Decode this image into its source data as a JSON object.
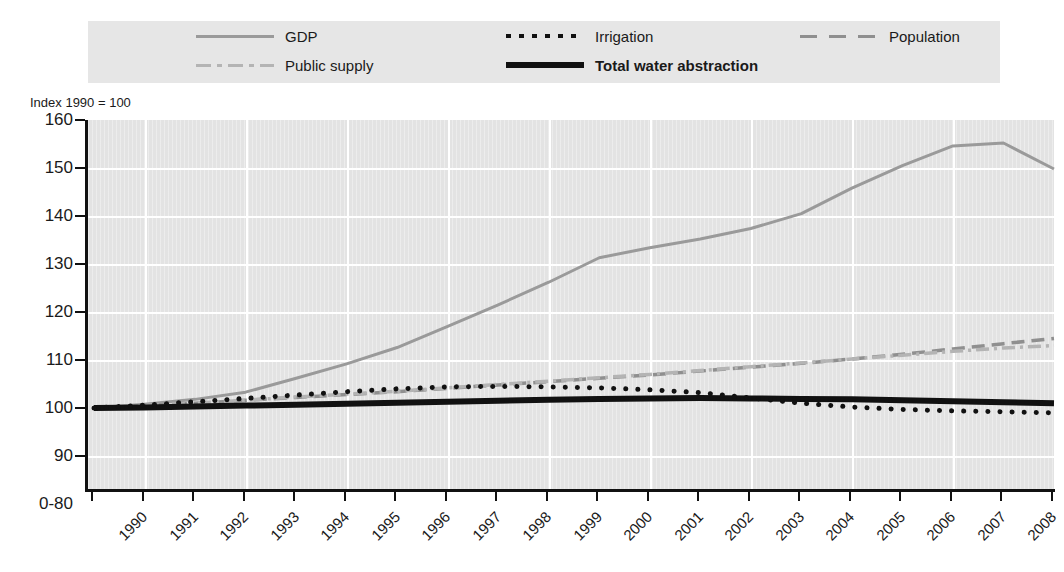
{
  "title": "",
  "axis_note": "Index 1990 = 100",
  "legend": {
    "items": [
      {
        "label": "GDP",
        "style": "solid-gray",
        "color": "#9a9a9a",
        "bold": false
      },
      {
        "label": "Irrigation",
        "style": "dotted",
        "color": "#111111",
        "bold": false
      },
      {
        "label": "Population",
        "style": "dashed",
        "color": "#8f8f8f",
        "bold": false
      },
      {
        "label": "Public supply",
        "style": "dash-dot",
        "color": "#b4b4b4",
        "bold": false
      },
      {
        "label": "Total water abstraction",
        "style": "bold-solid",
        "color": "#111111",
        "bold": true
      }
    ]
  },
  "chart_data": {
    "type": "line",
    "title": "",
    "xlabel": "",
    "ylabel": "Index 1990 = 100",
    "ylim": [
      80,
      160
    ],
    "ytick_labels": [
      "160",
      "150",
      "140",
      "130",
      "120",
      "110",
      "100",
      "90",
      "0-80"
    ],
    "ytick_values": [
      160,
      150,
      140,
      130,
      120,
      110,
      100,
      90,
      80
    ],
    "axis_break": "0-80",
    "grid": true,
    "legend_position": "top",
    "x": [
      1990,
      1991,
      1992,
      1993,
      1994,
      1995,
      1996,
      1997,
      1998,
      1999,
      2000,
      2001,
      2002,
      2003,
      2004,
      2005,
      2006,
      2007,
      2008,
      2009
    ],
    "categories": [
      "1990",
      "1991",
      "1992",
      "1993",
      "1994",
      "1995",
      "1996",
      "1997",
      "1998",
      "1999",
      "2000",
      "2001",
      "2002",
      "2003",
      "2004",
      "2005",
      "2006",
      "2007",
      "2008",
      "2009"
    ],
    "series": [
      {
        "name": "GDP",
        "color": "#9a9a9a",
        "style": "solid",
        "values": [
          100,
          100.8,
          101.8,
          103.3,
          106.2,
          109.2,
          112.6,
          117.0,
          121.5,
          126.2,
          131.3,
          133.4,
          135.2,
          137.4,
          140.5,
          145.8,
          150.5,
          154.6,
          155.2,
          149.8
        ]
      },
      {
        "name": "Population",
        "color": "#8f8f8f",
        "style": "dashed",
        "values": [
          100,
          100.5,
          101.0,
          101.6,
          102.2,
          102.8,
          103.4,
          104.1,
          104.8,
          105.5,
          106.2,
          106.9,
          107.7,
          108.5,
          109.3,
          110.2,
          111.2,
          112.3,
          113.4,
          114.5
        ]
      },
      {
        "name": "Public supply",
        "color": "#b4b4b4",
        "style": "dash-dot",
        "values": [
          100,
          100.5,
          101.0,
          101.6,
          102.3,
          102.9,
          103.5,
          104.2,
          104.9,
          105.6,
          106.3,
          107.0,
          107.8,
          108.6,
          109.4,
          110.2,
          111.0,
          111.8,
          112.5,
          113.0
        ]
      },
      {
        "name": "Total water abstraction",
        "color": "#111111",
        "style": "bold-solid",
        "values": [
          100,
          100.1,
          100.3,
          100.5,
          100.7,
          100.9,
          101.1,
          101.3,
          101.5,
          101.7,
          101.9,
          102.0,
          102.1,
          102.0,
          101.9,
          101.8,
          101.6,
          101.4,
          101.2,
          101.0
        ]
      },
      {
        "name": "Irrigation",
        "color": "#111111",
        "style": "dotted",
        "values": [
          100,
          100.6,
          101.3,
          102.0,
          102.7,
          103.4,
          104.0,
          104.4,
          104.5,
          104.4,
          104.2,
          103.8,
          103.2,
          102.1,
          101.0,
          100.2,
          99.7,
          99.4,
          99.2,
          99.0
        ]
      }
    ]
  },
  "caption": ""
}
